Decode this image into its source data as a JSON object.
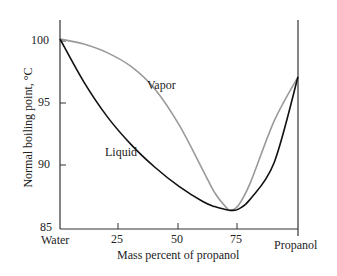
{
  "chart_data": {
    "type": "line",
    "title": "",
    "xlabel": "Mass percent of propanol",
    "ylabel": "Normal boiling point, °C",
    "xlim": [
      0,
      100
    ],
    "ylim": [
      85,
      100
    ],
    "x_ticks": [
      {
        "value": 0,
        "label": "Water"
      },
      {
        "value": 25,
        "label": "25"
      },
      {
        "value": 50,
        "label": "50"
      },
      {
        "value": 75,
        "label": "75"
      },
      {
        "value": 100,
        "label": "Propanol"
      }
    ],
    "y_ticks": [
      "85",
      "90",
      "95",
      "100"
    ],
    "grid": false,
    "legend": "inline labels",
    "series": [
      {
        "name": "Vapor",
        "color": "#999999",
        "x": [
          0,
          10,
          20,
          30,
          40,
          50,
          60,
          65,
          70,
          72,
          75,
          80,
          90,
          100
        ],
        "y": [
          100,
          99.6,
          98.9,
          97.8,
          96.0,
          93.2,
          89.6,
          87.8,
          86.6,
          86.4,
          86.8,
          88.6,
          93.5,
          97.0
        ]
      },
      {
        "name": "Liquid",
        "color": "#111111",
        "x": [
          0,
          10,
          20,
          30,
          40,
          50,
          60,
          65,
          70,
          72,
          75,
          80,
          90,
          100
        ],
        "y": [
          100,
          96.6,
          93.8,
          91.6,
          89.8,
          88.3,
          87.1,
          86.7,
          86.45,
          86.4,
          86.5,
          87.3,
          90.2,
          97.0
        ]
      }
    ],
    "annotations": [
      {
        "text": "Vapor",
        "x": 47,
        "y": 96.5
      },
      {
        "text": "Liquid",
        "x": 18,
        "y": 90.8
      }
    ]
  }
}
